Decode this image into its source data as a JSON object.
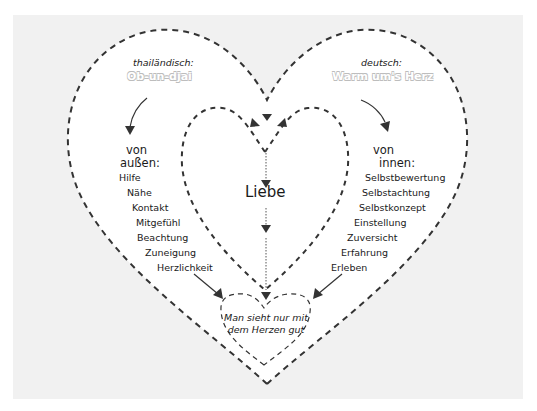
{
  "colors": {
    "background_outer": "#ffffff",
    "background_panel": "#f1f1f1",
    "heart_fill": "#ffffff",
    "dash_stroke": "#333333",
    "outline_text_stroke": "#bdbdbd"
  },
  "left": {
    "language_label": "thailändisch:",
    "term": "Ob-un-djai",
    "heading_line1": "von",
    "heading_line2": "außen:",
    "items": [
      "Hilfe",
      "Nähe",
      "Kontakt",
      "Mitgefühl",
      "Beachtung",
      "Zuneigung",
      "Herzlichkeit"
    ]
  },
  "right": {
    "language_label": "deutsch:",
    "term": "Warm um's Herz",
    "heading_line1": "von",
    "heading_line2": "innen:",
    "items": [
      "Selbstbewertung",
      "Selbstachtung",
      "Selbstkonzept",
      "Einstellung",
      "Zuversicht",
      "Erfahrung",
      "Erleben"
    ]
  },
  "center": {
    "label": "Liebe"
  },
  "bottom_heart": {
    "motto": "Man sieht nur mit dem Herzen gut"
  }
}
